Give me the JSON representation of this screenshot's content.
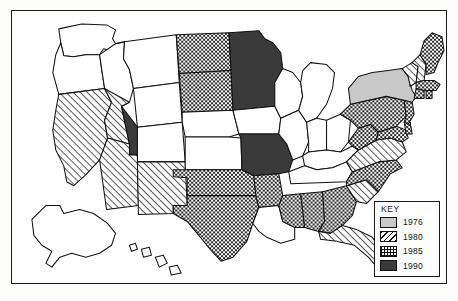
{
  "figure": {
    "type": "choropleth-map",
    "region": "United States"
  },
  "legend": {
    "title": "KEY",
    "entries": [
      {
        "label": "1976",
        "pattern": "solid-gray",
        "color": "#c9c9c9"
      },
      {
        "label": "1980",
        "pattern": "diagonal-hatch",
        "color": "#111111"
      },
      {
        "label": "1985",
        "pattern": "checkerboard",
        "color": "#111111"
      },
      {
        "label": "1990",
        "pattern": "solid-dark",
        "color": "#3a3a3a"
      }
    ]
  },
  "states": {
    "WA": "none",
    "OR": "none",
    "ID": "none",
    "MT": "none",
    "WY": "none",
    "CA": "1980",
    "NV": "1980",
    "UT": "1990",
    "AZ": "1980",
    "NM": "1980",
    "CO": "none",
    "ND": "1985",
    "SD": "1985",
    "NE": "none",
    "KS": "none",
    "OK": "1985",
    "TX": "1985",
    "MN": "1990",
    "IA": "none",
    "MO": "1990",
    "AR": "1985",
    "LA": "none",
    "WI": "none",
    "IL": "none",
    "MI": "none",
    "IN": "none",
    "OH": "none",
    "KY": "none",
    "TN": "none",
    "MS": "1985",
    "AL": "1985",
    "GA": "1985",
    "FL": "1980",
    "SC": "1980",
    "NC": "1985",
    "VA": "1980",
    "WV": "1985",
    "MD": "1985",
    "DE": "1985",
    "PA": "1985",
    "NJ": "1985",
    "NY": "1976",
    "CT": "1985",
    "RI": "1985",
    "MA": "1985",
    "VT": "1980",
    "NH": "1980",
    "ME": "1985",
    "AK": "none",
    "HI": "none"
  }
}
